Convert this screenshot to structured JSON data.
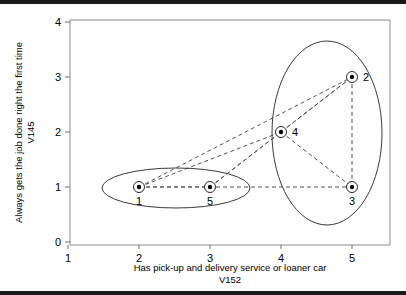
{
  "chart_data": {
    "type": "scatter",
    "title": "",
    "xlabel": "Has pick-up and delivery service or loaner car",
    "xlabel_code": "V152",
    "ylabel": "Always gets the job done right the first time",
    "ylabel_code": "V145",
    "xlim": [
      1,
      5
    ],
    "ylim": [
      0,
      4
    ],
    "xticks": [
      "1",
      "2",
      "3",
      "4",
      "5"
    ],
    "yticks": [
      "0",
      "1",
      "2",
      "3",
      "4"
    ],
    "grid": false,
    "legend": "none",
    "points": [
      {
        "label": "1",
        "x": 2,
        "y": 1,
        "label_pos": "below"
      },
      {
        "label": "5",
        "x": 3,
        "y": 1,
        "label_pos": "below"
      },
      {
        "label": "4",
        "x": 4,
        "y": 2,
        "label_pos": "right"
      },
      {
        "label": "2",
        "x": 5,
        "y": 3,
        "label_pos": "right"
      },
      {
        "label": "3",
        "x": 5,
        "y": 1,
        "label_pos": "below"
      }
    ],
    "links": [
      {
        "from": "1",
        "to": "5"
      },
      {
        "from": "1",
        "to": "3"
      },
      {
        "from": "1",
        "to": "4"
      },
      {
        "from": "1",
        "to": "2"
      },
      {
        "from": "5",
        "to": "4"
      },
      {
        "from": "5",
        "to": "2"
      },
      {
        "from": "4",
        "to": "2"
      },
      {
        "from": "4",
        "to": "3"
      },
      {
        "from": "2",
        "to": "3"
      }
    ],
    "clusters": [
      {
        "name": "cluster-left",
        "members": [
          "1",
          "5"
        ],
        "cx": 176,
        "cy": 188,
        "rx": 74,
        "ry": 20,
        "rotation": 0
      },
      {
        "name": "cluster-right",
        "members": [
          "2",
          "4",
          "3"
        ],
        "cx": 327,
        "cy": 133,
        "rx": 55,
        "ry": 92,
        "rotation": 0
      }
    ],
    "colors": {
      "point_fill": "#000000",
      "marker_stroke": "#2a2a2a",
      "link": "#555555",
      "ellipse": "#3a3a3a",
      "frame": "#8d8d8d",
      "background": "#ffffff"
    }
  }
}
